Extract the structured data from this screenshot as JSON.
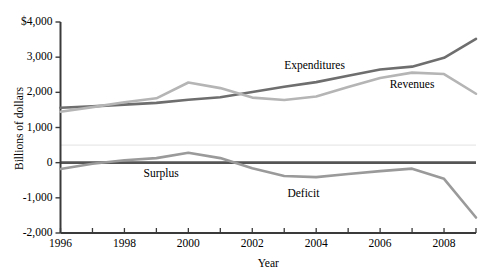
{
  "chart_data": {
    "type": "line",
    "title": "",
    "xlabel": "Year",
    "ylabel": "Billions of dollars",
    "xlim": [
      1996,
      2009
    ],
    "ylim": [
      -2000,
      4000
    ],
    "grid": false,
    "legend_position": "inline-annotations",
    "x": [
      1996,
      1997,
      1998,
      1999,
      2000,
      2001,
      2002,
      2003,
      2004,
      2005,
      2006,
      2007,
      2008,
      2009
    ],
    "ytick_labels": [
      "$4,000",
      "3,000",
      "2,000",
      "1,000",
      "0",
      "-1,000",
      "-2,000"
    ],
    "ytick_values": [
      4000,
      3000,
      2000,
      1000,
      0,
      -1000,
      -2000
    ],
    "xtick_labels": [
      "1996",
      "1998",
      "2000",
      "2002",
      "2004",
      "2006",
      "2008"
    ],
    "xtick_values": [
      1996,
      1998,
      2000,
      2002,
      2004,
      2006,
      2008
    ],
    "xtick_all_values": [
      1996,
      1997,
      1998,
      1999,
      2000,
      2001,
      2002,
      2003,
      2004,
      2005,
      2006,
      2007,
      2008,
      2009
    ],
    "reference_line": 500,
    "zero_line": 0,
    "series": [
      {
        "name": "Expenditures",
        "color": "#6e6e6e",
        "label_x": 2003.0,
        "label_y": 2750,
        "values": [
          1560,
          1600,
          1650,
          1700,
          1790,
          1860,
          2010,
          2160,
          2290,
          2470,
          2650,
          2730,
          2980,
          3520
        ]
      },
      {
        "name": "Revenues",
        "color": "#b5b5b5",
        "label_x": 2006.3,
        "label_y": 2200,
        "values": [
          1450,
          1580,
          1720,
          1830,
          2280,
          2120,
          1850,
          1780,
          1880,
          2150,
          2410,
          2560,
          2520,
          1960
        ]
      },
      {
        "name": "Surplus",
        "color": "#9a9a9a",
        "label_x": 1998.6,
        "label_y": -310,
        "values": [
          -180,
          -30,
          70,
          130,
          280,
          130,
          -160,
          -380,
          -410,
          -320,
          -240,
          -170,
          -460,
          -1560
        ]
      },
      {
        "name": "Deficit",
        "color": "#9a9a9a",
        "label_x": 2003.1,
        "label_y": -880,
        "values": null
      }
    ],
    "annotations": [
      {
        "text": "Expenditures",
        "x": 2003.0,
        "y": 2750
      },
      {
        "text": "Revenues",
        "x": 2006.3,
        "y": 2200
      },
      {
        "text": "Surplus",
        "x": 1998.6,
        "y": -310
      },
      {
        "text": "Deficit",
        "x": 2003.1,
        "y": -880
      }
    ]
  }
}
